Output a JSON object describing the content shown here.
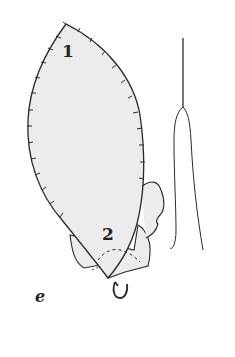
{
  "figure": {
    "panel_label": "e",
    "labels": [
      {
        "text": "1",
        "x": 62,
        "y": 57
      },
      {
        "text": "2",
        "x": 102,
        "y": 240
      }
    ],
    "colors": {
      "fill": "#ececec",
      "stroke": "#2a2a2a",
      "background": "#ffffff"
    }
  }
}
